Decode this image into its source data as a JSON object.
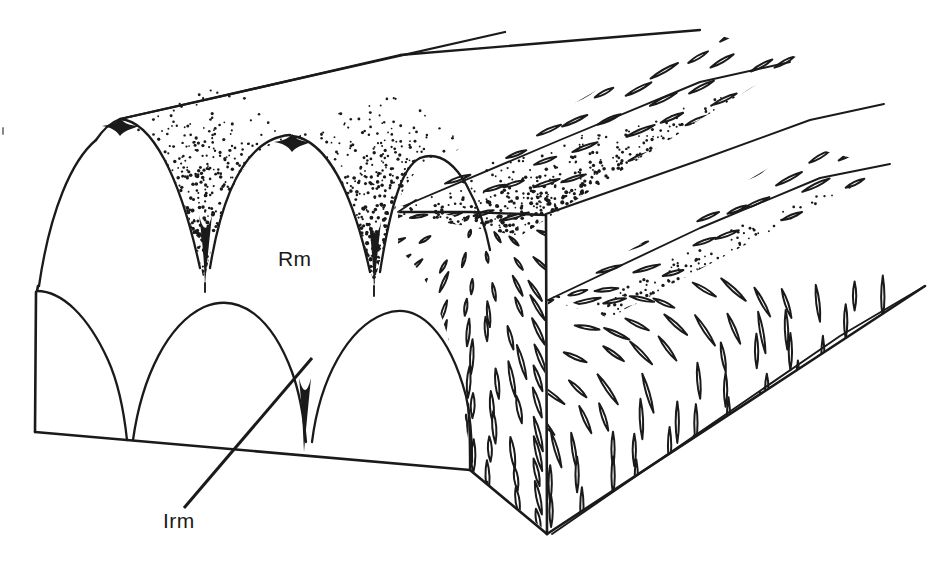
{
  "figure": {
    "kind": "block-diagram",
    "title": "",
    "background_color": "#ffffff",
    "ink_color": "#1a1a1a",
    "width": 942,
    "height": 564
  },
  "labels": [
    {
      "id": "rm",
      "text": "Rm",
      "x": 278,
      "y": 266,
      "anchor": "start",
      "has_leader": false
    },
    {
      "id": "irm",
      "text": "Irm",
      "x": 163,
      "y": 528,
      "anchor": "start",
      "has_leader": true,
      "leader": {
        "x1": 184,
        "y1": 508,
        "x2": 312,
        "y2": 358
      }
    }
  ],
  "ornament": {
    "stipple_name": "stipple-texture",
    "dash_name": "lenticular-dash-texture",
    "stipple_regions": [
      "upper-valley-left",
      "upper-valley-right",
      "upper-back-band"
    ],
    "dash_regions": [
      "front-cut-face",
      "right-cut-face",
      "upper-right-band",
      "lower-right-band"
    ]
  },
  "chart_data": {
    "type": "diagram",
    "title": "",
    "xlabel": "",
    "ylabel": "",
    "arch_rows": [
      {
        "row": "upper",
        "baseline_y": 285,
        "cusp_x": [
          205,
          375,
          470
        ],
        "crest_x": [
          120,
          290,
          425
        ],
        "crest_y": [
          130,
          148,
          165
        ]
      },
      {
        "row": "lower",
        "baseline_y": 470,
        "cusp_x": [
          128,
          300,
          470
        ],
        "crest_x": [
          60,
          215,
          385
        ],
        "crest_y": [
          295,
          310,
          325
        ]
      }
    ],
    "block_vertices": {
      "front_top_left": [
        35,
        290
      ],
      "front_bottom_left": [
        35,
        432
      ],
      "front_bottom_right": [
        470,
        470
      ],
      "cut_face_right": [
        545,
        530
      ],
      "back_top": [
        505,
        32
      ]
    }
  }
}
